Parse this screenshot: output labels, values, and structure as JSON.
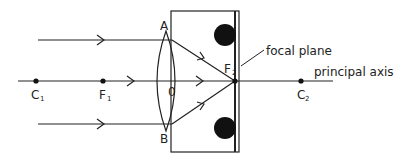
{
  "diagram": {
    "labels": {
      "A": "A",
      "B": "B",
      "O": "0",
      "C1": "C",
      "C1_sub": "1",
      "F1": "F",
      "F1_sub": "1",
      "F2": "F",
      "F2_sub": "2",
      "C2": "C",
      "C2_sub": "2",
      "focal_plane": "focal plane",
      "principal_axis": "principal axis"
    },
    "colors": {
      "line": "#222222",
      "background": "#ffffff",
      "dot": "#111111"
    }
  }
}
